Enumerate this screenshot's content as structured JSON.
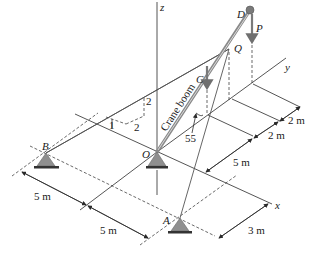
{
  "figure": {
    "type": "3D statics diagram: crane boom supported by cables",
    "axes": {
      "x": "x",
      "y": "y",
      "z": "z"
    },
    "points": {
      "origin": "O",
      "boom_tip": "D",
      "cable_attach": "Q",
      "center_of_gravity": "C",
      "support_a": "A",
      "support_b": "B"
    },
    "labels": {
      "boom": "Crane boom",
      "load": "P",
      "angle": "55",
      "slope_rise": "2",
      "slope_run": "2",
      "slope_one": "1"
    },
    "dimensions": {
      "y_seg_1": "2 m",
      "y_seg_2": "2 m",
      "y_seg_3": "5 m",
      "x_seg_1": "5 m",
      "x_seg_2": "5 m",
      "a_offset": "3 m"
    },
    "colors": {
      "line": "#2a2a2a",
      "boom": "#8a8a8a",
      "support": "#8f8f8f",
      "force": "#7a7a7a"
    }
  }
}
